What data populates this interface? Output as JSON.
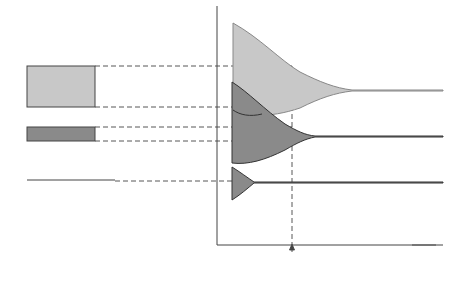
{
  "figure": {
    "panel_a": {
      "caption": "(a)",
      "y_axis_label": "Energy",
      "labels": {
        "upper_band": "Energy band",
        "gap": "Energy band gap",
        "lower_band": "Energy band"
      }
    },
    "panel_b": {
      "caption": "(b)",
      "y_axis_label": "Energy",
      "x_axis_label": "Interatomic separation",
      "x_axis_label_line1": "Interatomic",
      "x_axis_label_line2": "separation",
      "equilibrium_label_line1": "Equilibrium",
      "equilibrium_label_line2": "interatomic",
      "equilibrium_label_line3": "spacing"
    },
    "colors": {
      "upper_band_fill": "#c8c8c8",
      "lower_band_fill": "#8a8a8a",
      "line": "#333333"
    }
  }
}
